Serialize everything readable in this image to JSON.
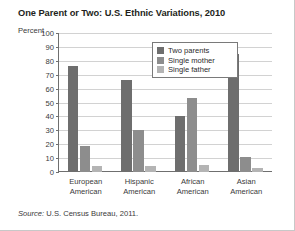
{
  "chart_data": {
    "type": "bar",
    "title": "One Parent or Two: U.S. Ethnic Variations, 2010",
    "xlabel": "",
    "ylabel": "Percent",
    "ylim": [
      0,
      100
    ],
    "ytick_step": 10,
    "yticks": [
      100,
      90,
      80,
      70,
      60,
      50,
      40,
      30,
      20,
      10,
      0
    ],
    "grid": true,
    "legend_position": "top-center",
    "categories": [
      "European American",
      "Hispanic American",
      "African American",
      "Asian American"
    ],
    "category_lines": [
      [
        "European",
        "American"
      ],
      [
        "Hispanic",
        "American"
      ],
      [
        "African",
        "American"
      ],
      [
        "Asian",
        "American"
      ]
    ],
    "series": [
      {
        "name": "Two parents",
        "color": "#6e6e6e",
        "values": [
          76,
          66,
          40,
          85
        ]
      },
      {
        "name": "Single mother",
        "color": "#8d8d8d",
        "values": [
          19,
          30,
          53,
          11
        ]
      },
      {
        "name": "Single father",
        "color": "#b4b4b4",
        "values": [
          4,
          4,
          5,
          3
        ]
      }
    ]
  },
  "source": {
    "prefix": "Source:",
    "body": " U.S. Census Bureau, 2011."
  }
}
